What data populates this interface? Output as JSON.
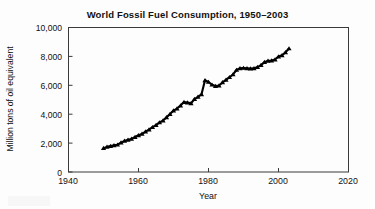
{
  "figure": {
    "background_color": "#fdfdfd",
    "ink_color": "#000000",
    "frame_color": "#3a3a3a"
  },
  "chart_data": {
    "type": "line",
    "title": "World Fossil Fuel Consumption, 1950–2003",
    "xlabel": "Year",
    "ylabel": "Million tons of oil equivalent",
    "xlim": [
      1940,
      2020
    ],
    "ylim": [
      0,
      10000
    ],
    "xticks": [
      1940,
      1960,
      1980,
      2000,
      2020
    ],
    "xtick_labels": [
      "1940",
      "1960",
      "1980",
      "2000",
      "2020"
    ],
    "yticks": [
      0,
      2000,
      4000,
      6000,
      8000,
      10000
    ],
    "ytick_labels": [
      "0",
      "2,000",
      "4,000",
      "6,000",
      "8,000",
      "10,000"
    ],
    "grid": false,
    "legend": false,
    "marker": "triangle-filled",
    "marker_color": "#000000",
    "series": [
      {
        "name": "World fossil fuel consumption",
        "x": [
          1950,
          1951,
          1952,
          1953,
          1954,
          1955,
          1956,
          1957,
          1958,
          1959,
          1960,
          1961,
          1962,
          1963,
          1964,
          1965,
          1966,
          1967,
          1968,
          1969,
          1970,
          1971,
          1972,
          1973,
          1974,
          1975,
          1976,
          1977,
          1978,
          1979,
          1980,
          1981,
          1982,
          1983,
          1984,
          1985,
          1986,
          1987,
          1988,
          1989,
          1990,
          1991,
          1992,
          1993,
          1994,
          1995,
          1996,
          1997,
          1998,
          1999,
          2000,
          2001,
          2002,
          2003
        ],
        "values": [
          1650,
          1740,
          1790,
          1850,
          1890,
          2030,
          2150,
          2230,
          2290,
          2420,
          2540,
          2640,
          2790,
          2940,
          3100,
          3250,
          3430,
          3560,
          3780,
          4010,
          4250,
          4390,
          4600,
          4840,
          4800,
          4750,
          5050,
          5200,
          5380,
          6350,
          6230,
          6040,
          5950,
          5980,
          6200,
          6380,
          6560,
          6750,
          7060,
          7180,
          7200,
          7180,
          7160,
          7170,
          7260,
          7400,
          7600,
          7700,
          7710,
          7780,
          7990,
          8080,
          8280,
          8550
        ]
      }
    ],
    "annotations": [
      {
        "text": "local peak around 1979",
        "year": 1979,
        "value": 6350
      },
      {
        "text": "dip through early 1980s",
        "year": 1982,
        "value": 5950
      },
      {
        "text": "plateau in early 1990s",
        "year": 1992,
        "value": 7160
      },
      {
        "text": "series end",
        "year": 2003,
        "value": 8550
      }
    ]
  }
}
